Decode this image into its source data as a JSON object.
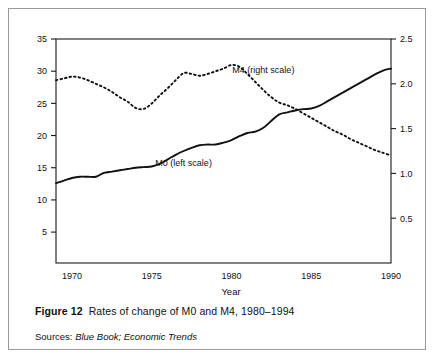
{
  "figure": {
    "number_label": "Figure 12",
    "caption_text": "Rates of change of M0 and M4, 1980–1994",
    "sources_label": "Sources:",
    "sources_value": "Blue Book; Economic Trends"
  },
  "chart_data": {
    "type": "line",
    "title": "",
    "xlabel": "Year",
    "ylabel": "",
    "grid": false,
    "legend_position": "inline-annotation",
    "xlim": [
      1969,
      1990
    ],
    "xticks": [
      "1970",
      "1975",
      "1980",
      "1985",
      "1990"
    ],
    "xtick_values": [
      1970,
      1975,
      1980,
      1985,
      1990
    ],
    "left_axis": {
      "label": "",
      "ylim": [
        0.2,
        35
      ],
      "yticks": [
        "5",
        "10",
        "15",
        "20",
        "25",
        "30",
        "35"
      ],
      "ytick_values": [
        5,
        10,
        15,
        20,
        25,
        30,
        35
      ]
    },
    "right_axis": {
      "label": "",
      "ylim": [
        0.0,
        2.5
      ],
      "yticks": [
        "0.5",
        "1.0",
        "1.5",
        "2.0",
        "2.5"
      ],
      "ytick_values": [
        0.5,
        1.0,
        1.5,
        2.0,
        2.5
      ]
    },
    "series": [
      {
        "name": "M0 (left scale)",
        "axis": "left",
        "style": "solid",
        "color": "#111111",
        "annotation": "M0 (left scale)",
        "annotation_x": 1977.0,
        "annotation_y": 15.2,
        "x": [
          1969.0,
          1969.5,
          1970.0,
          1970.5,
          1971.0,
          1971.5,
          1972.0,
          1972.5,
          1973.0,
          1973.5,
          1974.0,
          1974.5,
          1975.0,
          1975.5,
          1976.0,
          1976.5,
          1977.0,
          1977.5,
          1978.0,
          1978.5,
          1979.0,
          1979.5,
          1980.0,
          1980.5,
          1981.0,
          1981.5,
          1982.0,
          1982.5,
          1983.0,
          1983.5,
          1984.0,
          1984.5,
          1985.0,
          1985.5,
          1986.0,
          1986.5,
          1987.0,
          1987.5,
          1988.0,
          1988.5,
          1989.0,
          1989.5,
          1990.0
        ],
        "y": [
          12.6,
          13.0,
          13.4,
          13.6,
          13.6,
          13.6,
          14.2,
          14.4,
          14.6,
          14.8,
          15.0,
          15.1,
          15.2,
          15.6,
          16.3,
          17.0,
          17.6,
          18.1,
          18.5,
          18.6,
          18.6,
          18.9,
          19.3,
          19.9,
          20.4,
          20.6,
          21.2,
          22.3,
          23.3,
          23.6,
          23.9,
          24.1,
          24.2,
          24.6,
          25.3,
          26.0,
          26.7,
          27.4,
          28.1,
          28.8,
          29.5,
          30.1,
          30.4
        ]
      },
      {
        "name": "M4 (right scale)",
        "axis": "right",
        "style": "dotted",
        "color": "#111111",
        "annotation": "M4 (right scale)",
        "annotation_x": 1982.0,
        "annotation_y": 2.12,
        "x": [
          1969.0,
          1969.5,
          1970.0,
          1970.5,
          1971.0,
          1971.5,
          1972.0,
          1972.5,
          1973.0,
          1973.5,
          1974.0,
          1974.5,
          1975.0,
          1975.5,
          1976.0,
          1976.5,
          1977.0,
          1977.5,
          1978.0,
          1978.5,
          1979.0,
          1979.5,
          1980.0,
          1980.5,
          1981.0,
          1981.5,
          1982.0,
          1982.5,
          1983.0,
          1983.5,
          1984.0,
          1984.5,
          1985.0,
          1985.5,
          1986.0,
          1986.5,
          1987.0,
          1987.5,
          1988.0,
          1988.5,
          1989.0,
          1989.5,
          1990.0
        ],
        "y": [
          2.04,
          2.06,
          2.08,
          2.07,
          2.04,
          2.0,
          1.96,
          1.91,
          1.85,
          1.8,
          1.73,
          1.72,
          1.78,
          1.87,
          1.95,
          2.04,
          2.12,
          2.11,
          2.09,
          2.11,
          2.14,
          2.17,
          2.21,
          2.19,
          2.11,
          2.02,
          1.93,
          1.85,
          1.79,
          1.76,
          1.72,
          1.67,
          1.62,
          1.57,
          1.52,
          1.47,
          1.43,
          1.38,
          1.34,
          1.3,
          1.26,
          1.23,
          1.2
        ]
      }
    ]
  }
}
